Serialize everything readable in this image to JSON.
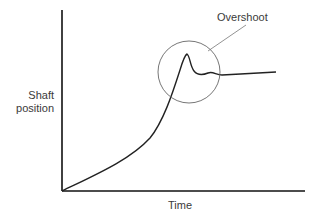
{
  "diagram": {
    "axes": {
      "y_label_line1": "Shaft",
      "y_label_line2": "position",
      "x_label": "Time"
    },
    "annotation": {
      "label": "Overshoot",
      "callout": "circle-around-peak"
    },
    "colors": {
      "axis": "#111111",
      "curve": "#222222",
      "annotation": "#666666",
      "text": "#3a3a3a"
    }
  }
}
